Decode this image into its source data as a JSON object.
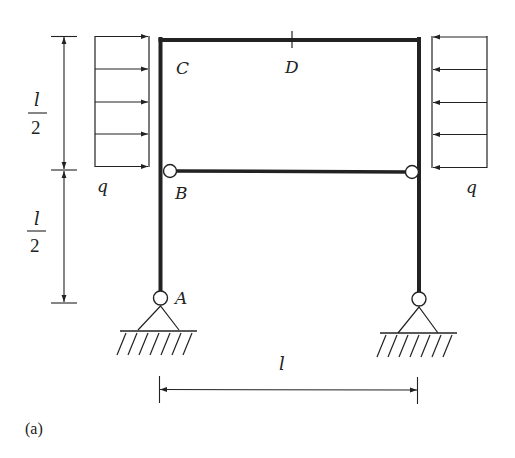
{
  "figure": {
    "caption": "(a)",
    "colors": {
      "stroke": "#222222",
      "background": "#ffffff"
    }
  },
  "labels": {
    "C": "C",
    "D": "D",
    "B": "B",
    "A": "A",
    "q_left": "q",
    "q_right": "q",
    "span": "l",
    "half_top_num": "l",
    "half_top_den": "2",
    "half_bottom_num": "l",
    "half_bottom_den": "2"
  },
  "dimensions": {
    "vertical": [
      {
        "name": "upper-half",
        "value": "l/2"
      },
      {
        "name": "lower-half",
        "value": "l/2"
      }
    ],
    "horizontal": {
      "name": "span",
      "value": "l"
    }
  },
  "loads": [
    {
      "name": "left-distributed-load",
      "symbol": "q",
      "direction": "right",
      "arrows": 5
    },
    {
      "name": "right-distributed-load",
      "symbol": "q",
      "direction": "left",
      "arrows": 5
    }
  ],
  "supports": [
    {
      "name": "support-A",
      "type": "pin"
    },
    {
      "name": "support-right",
      "type": "pin"
    }
  ],
  "hinges": [
    {
      "name": "hinge-B"
    },
    {
      "name": "hinge-right"
    }
  ]
}
